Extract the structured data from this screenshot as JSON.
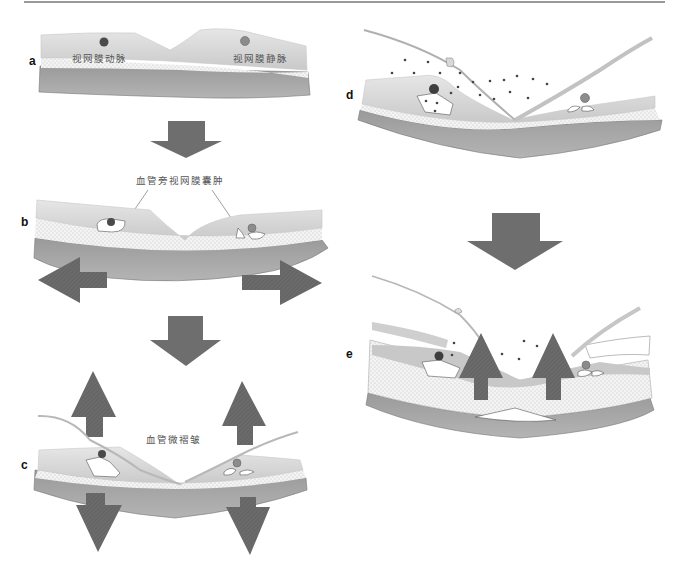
{
  "figure": {
    "colors": {
      "retina_light": "#d6d6d6",
      "retina_mid": "#bdbdbd",
      "choroid_band": "#a8a8a8",
      "choroid_dark": "#8a8a8a",
      "artery": "#4a4a4a",
      "vein": "#8c8c8c",
      "arrow": "#6e6e6e",
      "ilm_line": "#b8b8b8",
      "dots": "#444444"
    },
    "panels": [
      {
        "id": "a",
        "label": "a",
        "annotations": [
          {
            "key": "artery",
            "text": "视网膜动脉"
          },
          {
            "key": "vein",
            "text": "视网膜静脉"
          }
        ]
      },
      {
        "id": "b",
        "label": "b",
        "annotations": [
          {
            "key": "cyst",
            "text": "血管旁视网膜囊肿"
          }
        ],
        "arrows": [
          "left",
          "right"
        ]
      },
      {
        "id": "c",
        "label": "c",
        "annotations": [
          {
            "key": "microfold",
            "text": "血管微褶皱"
          }
        ],
        "arrows": [
          "up",
          "up",
          "down",
          "down"
        ]
      },
      {
        "id": "d",
        "label": "d",
        "annotations": []
      },
      {
        "id": "e",
        "label": "e",
        "annotations": [],
        "arrows": [
          "up",
          "up"
        ]
      }
    ],
    "transition_arrows": [
      "a-to-b",
      "b-to-c",
      "d-to-e"
    ]
  }
}
